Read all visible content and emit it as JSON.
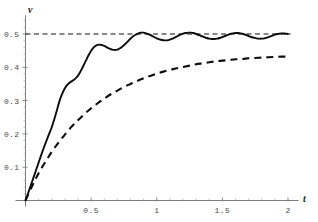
{
  "figure": {
    "background_color": "#ffffff",
    "axis_color": "#7d7d7d",
    "curve_color": "#0d0d0d"
  },
  "axes": {
    "x_axis_name": "t",
    "y_axis_name": "v",
    "x_ticks": [
      {
        "value": 0.5,
        "label": "0.5"
      },
      {
        "value": 1.0,
        "label": "1"
      },
      {
        "value": 1.5,
        "label": "1.5"
      },
      {
        "value": 2.0,
        "label": "2"
      }
    ],
    "y_ticks": [
      {
        "value": 0.1,
        "label": "0.1"
      },
      {
        "value": 0.2,
        "label": "0.2"
      },
      {
        "value": 0.3,
        "label": "0.3"
      },
      {
        "value": 0.4,
        "label": "0.4"
      },
      {
        "value": 0.5,
        "label": "0.5"
      }
    ]
  },
  "chart_data": {
    "type": "line",
    "title": "",
    "subtitle": "",
    "xlabel": "t",
    "ylabel": "v",
    "xlim": [
      0,
      2.05
    ],
    "ylim": [
      0,
      0.55
    ],
    "grid": false,
    "legend_position": "none",
    "annotations": [
      {
        "kind": "horizontal-asymptote",
        "y": 0.5,
        "label": "0.5",
        "style": "dashed",
        "x_start": 0.0,
        "x_end": 2.02
      }
    ],
    "series": [
      {
        "name": "damped oscillating response",
        "style": "solid",
        "color": "#0d0d0d",
        "asymptote": 0.5,
        "x": [
          0.0,
          0.02,
          0.04,
          0.06,
          0.08,
          0.1,
          0.12,
          0.14,
          0.16,
          0.18,
          0.2,
          0.22,
          0.24,
          0.26,
          0.28,
          0.3,
          0.32,
          0.34,
          0.36,
          0.38,
          0.4,
          0.42,
          0.44,
          0.46,
          0.48,
          0.5,
          0.52,
          0.54,
          0.56,
          0.58,
          0.6,
          0.62,
          0.64,
          0.66,
          0.68,
          0.7,
          0.72,
          0.74,
          0.76,
          0.78,
          0.8,
          0.82,
          0.84,
          0.86,
          0.88,
          0.9,
          0.92,
          0.94,
          0.96,
          0.98,
          1.0,
          1.02,
          1.04,
          1.06,
          1.08,
          1.1,
          1.12,
          1.14,
          1.16,
          1.18,
          1.2,
          1.22,
          1.24,
          1.26,
          1.28,
          1.3,
          1.32,
          1.34,
          1.36,
          1.38,
          1.4,
          1.42,
          1.44,
          1.46,
          1.48,
          1.5,
          1.52,
          1.54,
          1.56,
          1.58,
          1.6,
          1.62,
          1.64,
          1.66,
          1.68,
          1.7,
          1.72,
          1.74,
          1.76,
          1.78,
          1.8,
          1.82,
          1.84,
          1.86,
          1.88,
          1.9,
          1.92,
          1.94,
          1.96,
          1.98,
          2.0
        ],
        "y": [
          0.0,
          0.022,
          0.045,
          0.068,
          0.091,
          0.114,
          0.137,
          0.159,
          0.18,
          0.2,
          0.22,
          0.245,
          0.272,
          0.3,
          0.321,
          0.337,
          0.348,
          0.355,
          0.36,
          0.366,
          0.375,
          0.388,
          0.404,
          0.42,
          0.436,
          0.45,
          0.46,
          0.466,
          0.468,
          0.467,
          0.464,
          0.46,
          0.456,
          0.453,
          0.452,
          0.453,
          0.457,
          0.463,
          0.47,
          0.478,
          0.486,
          0.493,
          0.498,
          0.502,
          0.504,
          0.504,
          0.502,
          0.499,
          0.495,
          0.491,
          0.487,
          0.484,
          0.482,
          0.481,
          0.481,
          0.483,
          0.486,
          0.49,
          0.494,
          0.498,
          0.501,
          0.503,
          0.504,
          0.504,
          0.503,
          0.5,
          0.497,
          0.494,
          0.491,
          0.488,
          0.486,
          0.485,
          0.485,
          0.486,
          0.488,
          0.491,
          0.494,
          0.497,
          0.5,
          0.502,
          0.503,
          0.503,
          0.502,
          0.5,
          0.497,
          0.494,
          0.491,
          0.489,
          0.487,
          0.486,
          0.486,
          0.487,
          0.489,
          0.492,
          0.495,
          0.498,
          0.5,
          0.501,
          0.502,
          0.501,
          0.5
        ]
      },
      {
        "name": "overdamped monotonic response",
        "style": "dashed",
        "color": "#0d0d0d",
        "x": [
          0.0,
          0.05,
          0.1,
          0.15,
          0.2,
          0.25,
          0.3,
          0.35,
          0.4,
          0.45,
          0.5,
          0.55,
          0.6,
          0.65,
          0.7,
          0.75,
          0.8,
          0.85,
          0.9,
          0.95,
          1.0,
          1.05,
          1.1,
          1.15,
          1.2,
          1.25,
          1.3,
          1.35,
          1.4,
          1.45,
          1.5,
          1.55,
          1.6,
          1.65,
          1.7,
          1.75,
          1.8,
          1.85,
          1.9,
          1.95,
          2.0
        ],
        "y": [
          0.0,
          0.043,
          0.082,
          0.115,
          0.146,
          0.173,
          0.198,
          0.221,
          0.241,
          0.26,
          0.277,
          0.292,
          0.306,
          0.319,
          0.33,
          0.341,
          0.35,
          0.359,
          0.367,
          0.374,
          0.381,
          0.387,
          0.392,
          0.397,
          0.401,
          0.405,
          0.409,
          0.412,
          0.415,
          0.418,
          0.42,
          0.422,
          0.424,
          0.425,
          0.427,
          0.428,
          0.429,
          0.43,
          0.431,
          0.432,
          0.432
        ]
      }
    ]
  }
}
